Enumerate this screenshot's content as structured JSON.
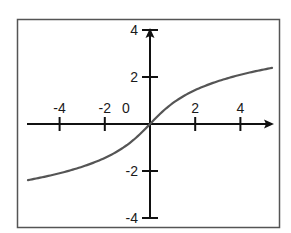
{
  "chart_data": {
    "type": "line",
    "title": "",
    "xlabel": "",
    "ylabel": "",
    "function": "y = arcsinh(x)",
    "xlim": [
      -5.4,
      5.4
    ],
    "ylim": [
      -4,
      4
    ],
    "grid": false,
    "legend": null,
    "x_ticks": [
      {
        "value": -4,
        "label": "-4"
      },
      {
        "value": -2,
        "label": "-2"
      },
      {
        "value": 2,
        "label": "2"
      },
      {
        "value": 4,
        "label": "4"
      }
    ],
    "origin_label": "0",
    "y_ticks": [
      {
        "value": 4,
        "label": "4"
      },
      {
        "value": 2,
        "label": "2"
      },
      {
        "value": -2,
        "label": "-2"
      },
      {
        "value": -4,
        "label": "-4"
      }
    ],
    "series": [
      {
        "name": "curve",
        "color": "#555555",
        "x": [
          -5.4,
          -5,
          -4,
          -3,
          -2,
          -1.5,
          -1,
          -0.5,
          0,
          0.5,
          1,
          1.5,
          2,
          3,
          4,
          5,
          5.4
        ],
        "y": [
          -2.39,
          -2.31,
          -2.09,
          -1.82,
          -1.44,
          -1.19,
          -0.88,
          -0.48,
          0,
          0.48,
          0.88,
          1.19,
          1.44,
          1.82,
          2.09,
          2.31,
          2.39
        ]
      }
    ]
  },
  "colors": {
    "axis": "#111111",
    "frame": "#555555",
    "curve": "#555555",
    "background": "#ffffff"
  }
}
